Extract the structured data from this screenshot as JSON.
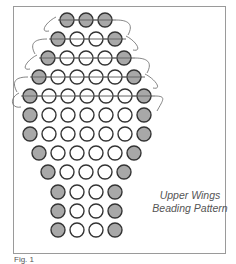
{
  "title": "Upper Wings Beading Pattern",
  "caption": {
    "line1": "Upper Wings",
    "line2": "Beading Pattern"
  },
  "figure_label": "Fig. 1",
  "colors": {
    "gray_bead": "#a8a8a8",
    "white_bead": "#ffffff",
    "bead_outline": "#333333",
    "thread": "#666666",
    "frame": "#9a9a9a"
  },
  "pattern": {
    "bead_spacing": 19,
    "bead_radius": 7,
    "rows": [
      {
        "y": 20,
        "x0": 67,
        "beads": [
          "G",
          "G",
          "G"
        ]
      },
      {
        "y": 39,
        "x0": 58,
        "beads": [
          "G",
          "W",
          "W",
          "G"
        ]
      },
      {
        "y": 58,
        "x0": 48,
        "beads": [
          "G",
          "W",
          "W",
          "W",
          "G"
        ]
      },
      {
        "y": 77,
        "x0": 39,
        "beads": [
          "G",
          "W",
          "W",
          "W",
          "W",
          "G"
        ]
      },
      {
        "y": 96,
        "x0": 30,
        "beads": [
          "G",
          "W",
          "W",
          "W",
          "W",
          "W",
          "G"
        ]
      },
      {
        "y": 115,
        "x0": 30,
        "beads": [
          "G",
          "W",
          "W",
          "W",
          "W",
          "W",
          "G"
        ]
      },
      {
        "y": 134,
        "x0": 30,
        "beads": [
          "G",
          "W",
          "W",
          "W",
          "W",
          "W",
          "G"
        ]
      },
      {
        "y": 153,
        "x0": 39,
        "beads": [
          "G",
          "W",
          "W",
          "W",
          "W",
          "G"
        ]
      },
      {
        "y": 172,
        "x0": 48,
        "beads": [
          "G",
          "W",
          "W",
          "W",
          "G"
        ]
      },
      {
        "y": 192,
        "x0": 58,
        "beads": [
          "G",
          "W",
          "W",
          "G"
        ]
      },
      {
        "y": 211,
        "x0": 58,
        "beads": [
          "G",
          "W",
          "W",
          "G"
        ]
      },
      {
        "y": 230,
        "x0": 58,
        "beads": [
          "G",
          "W",
          "W",
          "G"
        ]
      }
    ],
    "threaded_rows": 5
  }
}
